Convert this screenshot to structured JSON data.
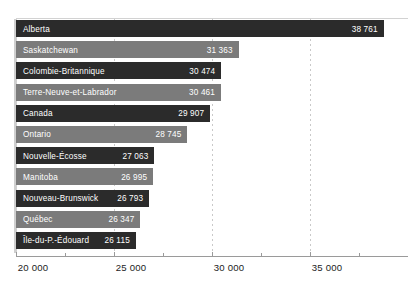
{
  "chart_data": {
    "type": "bar",
    "orientation": "horizontal",
    "title": "",
    "subtitle": "",
    "xlabel": "",
    "ylabel": "",
    "grid": true,
    "legend": null,
    "xlim": [
      20000,
      40000
    ],
    "xticks": [
      20000,
      25000,
      30000,
      35000
    ],
    "xticklabels": [
      "20 000",
      "25 000",
      "30 000",
      "35 000"
    ],
    "minor_xticks": [
      22500,
      27500,
      32500,
      37500
    ],
    "gridlines": [
      25000,
      30000,
      35000
    ],
    "categories": [
      "Alberta",
      "Saskatchewan",
      "Colombie-Britannique",
      "Terre-Neuve-et-Labrador",
      "Canada",
      "Ontario",
      "Nouvelle-Écosse",
      "Manitoba",
      "Nouveau-Brunswick",
      "Québec",
      "Île-du-P.-Édouard"
    ],
    "values": [
      38761,
      31363,
      30474,
      30461,
      29907,
      28745,
      27063,
      26995,
      26793,
      26347,
      26115
    ],
    "value_labels": [
      "38 761",
      "31 363",
      "30 474",
      "30 461",
      "29 907",
      "28 745",
      "27 063",
      "26 995",
      "26 793",
      "26 347",
      "26 115"
    ],
    "bar_colors": [
      "#2b2b2b",
      "#7b7b7b",
      "#2b2b2b",
      "#7b7b7b",
      "#2b2b2b",
      "#7b7b7b",
      "#2b2b2b",
      "#7b7b7b",
      "#2b2b2b",
      "#7b7b7b",
      "#2b2b2b"
    ]
  },
  "colors": {
    "dark_bar": "#2b2b2b",
    "mid_bar": "#7b7b7b",
    "grid": "#c9c9c9",
    "axis": "#9a9a9a",
    "background": "#ffffff",
    "bar_text": "#ffffff",
    "tick_text": "#1c1c1c"
  }
}
